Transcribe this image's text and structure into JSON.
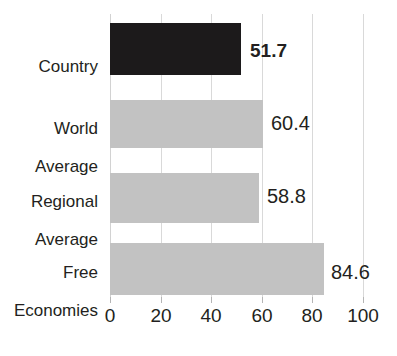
{
  "chart_data": {
    "type": "bar",
    "orientation": "horizontal",
    "title": "",
    "xlabel": "",
    "ylabel": "",
    "xlim": [
      0,
      100
    ],
    "xticks": [
      0,
      20,
      40,
      60,
      80,
      100
    ],
    "xtick_labels": [
      "0",
      "20",
      "40",
      "60",
      "80",
      "100"
    ],
    "grid": true,
    "legend": "none",
    "categories": [
      "Country",
      "World Average",
      "Regional Average",
      "Free Economies"
    ],
    "values": [
      51.7,
      60.4,
      58.8,
      84.6
    ],
    "value_labels": [
      "51.7",
      "60.4",
      "58.8",
      "84.6"
    ],
    "bars": [
      {
        "category": "Country",
        "label_line1": "Country",
        "label_line2": "",
        "value": 51.7,
        "value_label": "51.7",
        "color": "#1c1a1b",
        "emphasis": true
      },
      {
        "category": "World Average",
        "label_line1": "World",
        "label_line2": "Average",
        "value": 60.4,
        "value_label": "60.4",
        "color": "#c2c2c2",
        "emphasis": false
      },
      {
        "category": "Regional Average",
        "label_line1": "Regional",
        "label_line2": "Average",
        "value": 58.8,
        "value_label": "58.8",
        "color": "#c2c2c2",
        "emphasis": false
      },
      {
        "category": "Free Economies",
        "label_line1": "Free",
        "label_line2": "Economies",
        "value": 84.6,
        "value_label": "84.6",
        "color": "#c2c2c2",
        "emphasis": false
      }
    ],
    "colors": {
      "highlight_bar": "#1c1a1b",
      "default_bar": "#c2c2c2",
      "gridline": "#d9d9d9",
      "text": "#231f20",
      "background": "#ffffff"
    }
  }
}
